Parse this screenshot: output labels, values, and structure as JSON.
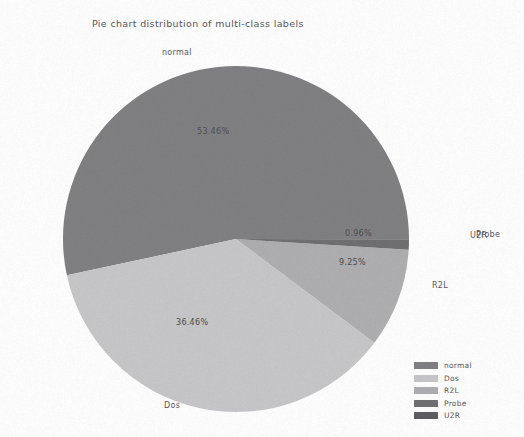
{
  "chart_data": {
    "type": "pie",
    "title": "Pie chart distribution of multi-class labels",
    "categories": [
      "normal",
      "Dos",
      "R2L",
      "Probe",
      "U2R"
    ],
    "values": [
      53.46,
      36.46,
      9.25,
      0.96,
      0.04
    ],
    "value_labels": [
      "53.46%",
      "36.46%",
      "9.25%",
      "0.96%",
      ""
    ],
    "outer_labels": [
      "normal",
      "Dos",
      "R2L",
      "Probe",
      "U2R"
    ],
    "colors": [
      "#808083",
      "#c6c6c8",
      "#aeaeb1",
      "#6f6f72",
      "#5d5d60"
    ],
    "legend_position": "lower-right",
    "grid": false,
    "xlabel": "",
    "ylabel": ""
  },
  "title": {
    "text": "Pie chart distribution of multi-class labels"
  },
  "slices": [
    {
      "name": "normal",
      "percent_label": "53.46%",
      "outer_label": "normal",
      "color": "#808083"
    },
    {
      "name": "Dos",
      "percent_label": "36.46%",
      "outer_label": "Dos",
      "color": "#c6c6c8"
    },
    {
      "name": "R2L",
      "percent_label": "9.25%",
      "outer_label": "R2L",
      "color": "#aeaeb1"
    },
    {
      "name": "Probe",
      "percent_label": "0.96%",
      "outer_label": "Probe",
      "color": "#6f6f72"
    },
    {
      "name": "U2R",
      "percent_label": "",
      "outer_label": "U2R",
      "color": "#5d5d60"
    }
  ],
  "legend": {
    "entries": [
      {
        "label": "normal",
        "color": "#808083"
      },
      {
        "label": "Dos",
        "color": "#c6c6c8"
      },
      {
        "label": "R2L",
        "color": "#aeaeb1"
      },
      {
        "label": "Probe",
        "color": "#6f6f72"
      },
      {
        "label": "U2R",
        "color": "#5d5d60"
      }
    ]
  }
}
